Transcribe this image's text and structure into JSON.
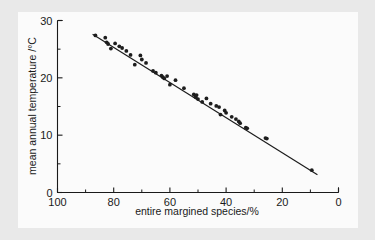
{
  "figure": {
    "background_color": "#e9e9e9",
    "panel_color": "#fbfbfb",
    "ink_color": "#1a1a1a"
  },
  "chart_data": {
    "type": "scatter",
    "title": "",
    "xlabel": "entire margined species/%",
    "ylabel": "mean annual temperature /°C",
    "xlim": [
      100,
      0
    ],
    "ylim": [
      0,
      30
    ],
    "x_axis_reversed": true,
    "grid": false,
    "legend": null,
    "xticks": [
      100,
      80,
      60,
      40,
      20,
      0
    ],
    "xtick_labels": [
      "100",
      "80",
      "60",
      "40",
      "20",
      "0"
    ],
    "xticks_minor": [
      90,
      70,
      50,
      30,
      10
    ],
    "yticks": [
      0,
      10,
      20,
      30
    ],
    "ytick_labels": [
      "0",
      "10",
      "20",
      "30"
    ],
    "yticks_minor": [
      5,
      15,
      25
    ],
    "marker": "filled-circle",
    "points": [
      {
        "x": 86.5,
        "y": 27.4
      },
      {
        "x": 83.0,
        "y": 27.0
      },
      {
        "x": 82.5,
        "y": 26.2
      },
      {
        "x": 82.0,
        "y": 25.9
      },
      {
        "x": 81.0,
        "y": 25.1
      },
      {
        "x": 79.5,
        "y": 26.0
      },
      {
        "x": 78.0,
        "y": 25.5
      },
      {
        "x": 77.0,
        "y": 25.2
      },
      {
        "x": 75.5,
        "y": 24.7
      },
      {
        "x": 74.0,
        "y": 24.0
      },
      {
        "x": 72.5,
        "y": 22.3
      },
      {
        "x": 70.5,
        "y": 23.9
      },
      {
        "x": 70.0,
        "y": 23.2
      },
      {
        "x": 68.5,
        "y": 22.6
      },
      {
        "x": 66.0,
        "y": 21.2
      },
      {
        "x": 65.0,
        "y": 20.9
      },
      {
        "x": 63.0,
        "y": 20.4
      },
      {
        "x": 62.5,
        "y": 20.1
      },
      {
        "x": 62.0,
        "y": 19.9
      },
      {
        "x": 61.0,
        "y": 20.3
      },
      {
        "x": 60.0,
        "y": 18.8
      },
      {
        "x": 58.0,
        "y": 19.6
      },
      {
        "x": 55.0,
        "y": 18.2
      },
      {
        "x": 51.5,
        "y": 17.1
      },
      {
        "x": 51.0,
        "y": 16.9
      },
      {
        "x": 50.8,
        "y": 16.6
      },
      {
        "x": 50.5,
        "y": 17.0
      },
      {
        "x": 50.0,
        "y": 16.3
      },
      {
        "x": 48.5,
        "y": 15.8
      },
      {
        "x": 47.0,
        "y": 16.4
      },
      {
        "x": 45.5,
        "y": 15.5
      },
      {
        "x": 43.5,
        "y": 15.1
      },
      {
        "x": 42.5,
        "y": 14.9
      },
      {
        "x": 42.0,
        "y": 13.6
      },
      {
        "x": 40.5,
        "y": 14.3
      },
      {
        "x": 40.0,
        "y": 13.9
      },
      {
        "x": 38.0,
        "y": 13.2
      },
      {
        "x": 36.5,
        "y": 12.8
      },
      {
        "x": 35.5,
        "y": 12.4
      },
      {
        "x": 35.0,
        "y": 12.1
      },
      {
        "x": 33.0,
        "y": 11.3
      },
      {
        "x": 32.5,
        "y": 11.2
      },
      {
        "x": 26.0,
        "y": 9.5
      },
      {
        "x": 25.5,
        "y": 9.4
      },
      {
        "x": 9.5,
        "y": 3.9
      }
    ],
    "fit_line": {
      "label": "regression line",
      "x_start": 87.5,
      "y_start": 27.6,
      "x_end": 7.5,
      "y_end": 3.1
    }
  }
}
